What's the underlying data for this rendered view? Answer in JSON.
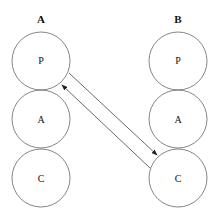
{
  "columns": [
    {
      "header": "A",
      "nodes": [
        "P",
        "A",
        "C"
      ]
    },
    {
      "header": "B",
      "nodes": [
        "P",
        "A",
        "C"
      ]
    }
  ],
  "edges": [
    {
      "from": "A.P",
      "to": "B.C",
      "direction": "forward"
    },
    {
      "from": "B.C",
      "to": "A.P",
      "direction": "backward"
    }
  ],
  "colors": {
    "stroke": "#555555",
    "text": "#111111"
  }
}
